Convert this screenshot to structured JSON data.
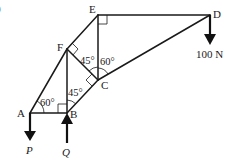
{
  "diagram": {
    "type": "truss",
    "clipped_label": ")",
    "nodes": {
      "A": {
        "label": "A"
      },
      "B": {
        "label": "B"
      },
      "C": {
        "label": "C"
      },
      "D": {
        "label": "D"
      },
      "E": {
        "label": "E"
      },
      "F": {
        "label": "F"
      }
    },
    "members": [
      "AF",
      "FE",
      "ED",
      "DC",
      "CB",
      "AB",
      "FB",
      "FC",
      "EC"
    ],
    "right_angles": [
      "E (between ED and EC)",
      "F (between FE and FC)",
      "C (between CF and CB)",
      "B (between BA and BF)"
    ],
    "angles": [
      {
        "at": "A",
        "text": "60°"
      },
      {
        "at": "B",
        "text": "45°"
      },
      {
        "at": "C-left",
        "text": "45°"
      },
      {
        "at": "C-right",
        "text": "60°"
      }
    ],
    "forces": [
      {
        "at": "A",
        "direction": "down",
        "label": "P"
      },
      {
        "at": "B",
        "direction": "up",
        "label": "Q"
      },
      {
        "at": "D",
        "direction": "down",
        "label": "100 N"
      }
    ]
  }
}
